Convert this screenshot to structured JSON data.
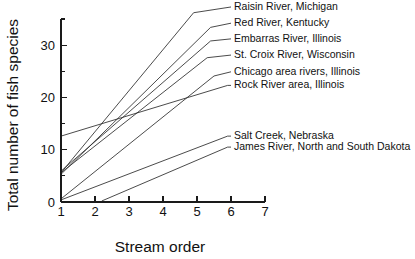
{
  "chart_data": {
    "type": "line",
    "title": "",
    "xlabel": "Stream order",
    "ylabel": "Total number of fish species",
    "xlim": [
      1,
      7
    ],
    "ylim": [
      0,
      35
    ],
    "x_ticks": [
      1,
      2,
      3,
      4,
      5,
      6,
      7
    ],
    "x_tick_labels": [
      "1",
      "2",
      "3",
      "4",
      "5",
      "6",
      "7"
    ],
    "y_ticks": [
      0,
      10,
      20,
      30
    ],
    "y_tick_labels": [
      "0",
      "10",
      "20",
      "30"
    ],
    "y_minor_ticks": [
      5,
      15,
      25,
      35
    ],
    "grid": false,
    "legend_position": "right-inline-labels",
    "line_color": "#2a2a2a",
    "series": [
      {
        "name": "Raisin River, Michigan",
        "label": "Raisin River, Michigan",
        "x": [
          1,
          4.9
        ],
        "values": [
          5.6,
          36.2
        ],
        "label_x": 6.0,
        "label_y": 37.3
      },
      {
        "name": "Red River, Kentucky",
        "label": "Red River, Kentucky",
        "x": [
          1,
          5.4
        ],
        "values": [
          5.3,
          33.4
        ],
        "label_x": 6.0,
        "label_y": 34.2
      },
      {
        "name": "Embarras River, Illinois",
        "label": "Embarras River, Illinois",
        "x": [
          1,
          5.4
        ],
        "values": [
          5.9,
          30.8
        ],
        "label_x": 6.0,
        "label_y": 31.2
      },
      {
        "name": "St. Croix River, Wisconsin",
        "label": "St. Croix River, Wisconsin",
        "x": [
          1,
          5.3
        ],
        "values": [
          5.6,
          27.6
        ],
        "label_x": 6.0,
        "label_y": 28.1
      },
      {
        "name": "Chicago area rivers, Illinois",
        "label": "Chicago area rivers, Illinois",
        "x": [
          1,
          5.5
        ],
        "values": [
          0.6,
          24.1
        ],
        "label_x": 6.0,
        "label_y": 24.9
      },
      {
        "name": "Rock River area, Illinois",
        "label": "Rock River area, Illinois",
        "x": [
          1,
          5.9
        ],
        "values": [
          12.6,
          22.3
        ],
        "label_x": 6.0,
        "label_y": 22.3
      },
      {
        "name": "Salt Creek, Nebraska",
        "label": "Salt Creek, Nebraska",
        "x": [
          1,
          5.9
        ],
        "values": [
          0.4,
          12.6
        ],
        "label_x": 6.0,
        "label_y": 12.6
      },
      {
        "name": "James River, North and South Dakota",
        "label": "James River, North and South Dakota",
        "x": [
          2.2,
          5.9
        ],
        "values": [
          0.2,
          10.5
        ],
        "label_x": 6.0,
        "label_y": 10.5
      }
    ]
  }
}
